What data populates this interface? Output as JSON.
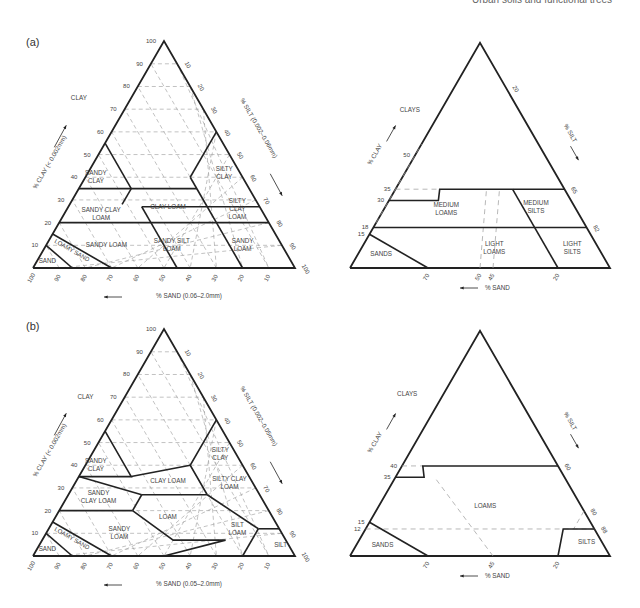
{
  "header": {
    "running_title": "Urban soils and functional trees"
  },
  "panels": [
    {
      "label": "(a)",
      "left": {
        "axis_clay": "% CLAY (< 0.002mm)",
        "axis_silt": "% SILT (0.002–0.06mm)",
        "axis_sand": "% SAND (0.06–2.0mm)",
        "clay_ticks": [
          "10",
          "20",
          "30",
          "40",
          "50",
          "60",
          "70",
          "80",
          "90",
          "100"
        ],
        "silt_ticks": [
          "10",
          "20",
          "30",
          "40",
          "50",
          "60",
          "70",
          "80",
          "90",
          "100"
        ],
        "sand_ticks": [
          "100",
          "90",
          "80",
          "70",
          "60",
          "50",
          "40",
          "30",
          "20",
          "10"
        ],
        "classes": [
          "CLAY",
          "SANDY CLAY",
          "SILTY CLAY",
          "SANDY CLAY LOAM",
          "CLAY LOAM",
          "SILTY CLAY LOAM",
          "SANDY LOAM",
          "SANDY SILT LOAM",
          "SANDY LOAM",
          "LOAMY SAND",
          "SAND"
        ]
      },
      "right": {
        "axis_clay": "% CLAY",
        "axis_silt": "% SILT",
        "axis_sand": "% SAND",
        "clay_ticks": [
          "50",
          "35",
          "30",
          "18",
          "15"
        ],
        "silt_ticks": [
          "20",
          "65",
          "82"
        ],
        "sand_ticks": [
          "70",
          "50",
          "45",
          "20"
        ],
        "classes": [
          "CLAYS",
          "MEDIUM LOAMS",
          "MEDIUM SILTS",
          "LIGHT LOAMS",
          "LIGHT SILTS",
          "SANDS"
        ]
      }
    },
    {
      "label": "(b)",
      "left": {
        "axis_clay": "% CLAY (< 0.002mm)",
        "axis_silt": "% SILT (0.002–0.05mm)",
        "axis_sand": "% SAND (0.05–2.0mm)",
        "clay_ticks": [
          "10",
          "20",
          "30",
          "40",
          "50",
          "60",
          "70",
          "80",
          "90",
          "100"
        ],
        "silt_ticks": [
          "10",
          "20",
          "30",
          "40",
          "50",
          "60",
          "70",
          "80",
          "90",
          "100"
        ],
        "sand_ticks": [
          "100",
          "90",
          "80",
          "70",
          "60",
          "50",
          "40",
          "30",
          "20",
          "10"
        ],
        "classes": [
          "CLAY",
          "SANDY CLAY",
          "SILTY CLAY",
          "SANDY CLAY LOAM",
          "CLAY LOAM",
          "SILTY CLAY LOAM",
          "SANDY LOAM",
          "LOAM",
          "SILT LOAM",
          "SILT",
          "LOAMY SAND",
          "SAND"
        ]
      },
      "right": {
        "axis_clay": "% CLAY",
        "axis_silt": "% SILT",
        "axis_sand": "% SAND",
        "clay_ticks": [
          "40",
          "35",
          "15",
          "12"
        ],
        "silt_ticks": [
          "60",
          "80",
          "88"
        ],
        "sand_ticks": [
          "70",
          "45",
          "20"
        ],
        "classes": [
          "CLAYS",
          "LOAMS",
          "SANDS",
          "SILTS"
        ]
      }
    }
  ]
}
